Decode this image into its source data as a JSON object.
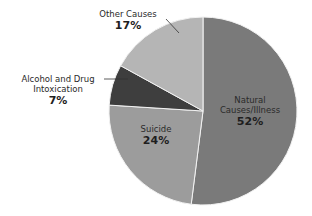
{
  "chart_data": {
    "type": "pie",
    "title": "",
    "start_angle": "12 o'clock, clockwise",
    "slices": [
      {
        "label": "Natural Causes/Illness",
        "value": 52,
        "display": "52%",
        "color": "#7a7a7a"
      },
      {
        "label": "Suicide",
        "value": 24,
        "display": "24%",
        "color": "#9c9c9c"
      },
      {
        "label": "Alcohol and Drug Intoxication",
        "value": 7,
        "display": "7%",
        "color": "#3e3e3e"
      },
      {
        "label": "Other Causes",
        "value": 17,
        "display": "17%",
        "color": "#b5b5b5"
      }
    ]
  },
  "labels": {
    "natural_line1": "Natural",
    "natural_line2": "Causes/Illness",
    "natural_pct": "52%",
    "suicide": "Suicide",
    "suicide_pct": "24%",
    "alcohol_line1": "Alcohol and Drug",
    "alcohol_line2": "Intoxication",
    "alcohol_pct": "7%",
    "other": "Other Causes",
    "other_pct": "17%"
  }
}
